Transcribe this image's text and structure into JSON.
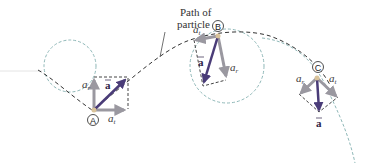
{
  "figure": {
    "caption_line1": "Path of",
    "caption_line2": "particle",
    "vector_symbol": "a",
    "colors": {
      "path": "#333333",
      "circle": "#8fb8b8",
      "component_arrow": "#9a98a0",
      "total_arrow": "#4a3c78",
      "point_dot": "#d9c39a",
      "dashed_box": "#444444"
    },
    "points": [
      {
        "id": "A",
        "label": "A",
        "tangential_label": "a",
        "tangential_sub": "t",
        "radial_label": "a",
        "radial_sub": "r",
        "accel_label": "a"
      },
      {
        "id": "B",
        "label": "B",
        "tangential_label": "a",
        "tangential_sub": "t",
        "radial_label": "a",
        "radial_sub": "r",
        "accel_label": "a"
      },
      {
        "id": "C",
        "label": "C",
        "tangential_label": "a",
        "tangential_sub": "t",
        "radial_label": "a",
        "radial_sub": "r",
        "accel_label": "a"
      }
    ]
  }
}
